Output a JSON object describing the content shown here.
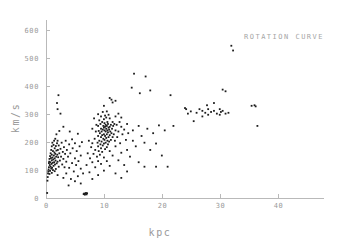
{
  "chart_data": {
    "type": "scatter",
    "title": "ROTATION CURVE",
    "xlabel": "kpc",
    "ylabel": "km/s",
    "xlim": [
      0,
      48
    ],
    "ylim": [
      0,
      630
    ],
    "grid": false,
    "legend": null,
    "xticks": [
      0,
      10,
      20,
      30,
      40
    ],
    "yticks": [
      0,
      100,
      200,
      300,
      400,
      500,
      600
    ],
    "xtick_labels": [
      "0",
      "10",
      "20",
      "30",
      "40"
    ],
    "ytick_labels": [
      "0",
      "100",
      "200",
      "300",
      "400",
      "500",
      "600"
    ],
    "marker": "dot",
    "marker_color": "#1d1d1d",
    "axis_color": "#b9b9b9",
    "label_color": "#9a9a9a",
    "n_points": 286,
    "points": [
      [
        0.2,
        18
      ],
      [
        0.25,
        62
      ],
      [
        0.3,
        75
      ],
      [
        0.35,
        88
      ],
      [
        0.4,
        95
      ],
      [
        0.45,
        102
      ],
      [
        0.5,
        110
      ],
      [
        0.5,
        125
      ],
      [
        0.55,
        130
      ],
      [
        0.6,
        86
      ],
      [
        0.6,
        140
      ],
      [
        0.65,
        118
      ],
      [
        0.7,
        97
      ],
      [
        0.7,
        150
      ],
      [
        0.75,
        128
      ],
      [
        0.8,
        112
      ],
      [
        0.8,
        160
      ],
      [
        0.85,
        143
      ],
      [
        0.9,
        105
      ],
      [
        0.9,
        172
      ],
      [
        0.95,
        122
      ],
      [
        1.0,
        90
      ],
      [
        1.0,
        135
      ],
      [
        1.0,
        155
      ],
      [
        1.0,
        185
      ],
      [
        1.05,
        108
      ],
      [
        1.1,
        145
      ],
      [
        1.1,
        198
      ],
      [
        1.15,
        126
      ],
      [
        1.2,
        100
      ],
      [
        1.2,
        168
      ],
      [
        1.25,
        138
      ],
      [
        1.3,
        115
      ],
      [
        1.3,
        190
      ],
      [
        1.35,
        152
      ],
      [
        1.4,
        128
      ],
      [
        1.4,
        205
      ],
      [
        1.45,
        163
      ],
      [
        1.5,
        96
      ],
      [
        1.5,
        142
      ],
      [
        1.5,
        178
      ],
      [
        1.55,
        120
      ],
      [
        1.6,
        158
      ],
      [
        1.6,
        212
      ],
      [
        1.65,
        134
      ],
      [
        1.7,
        104
      ],
      [
        1.7,
        186
      ],
      [
        1.75,
        148
      ],
      [
        1.8,
        170
      ],
      [
        1.8,
        228
      ],
      [
        1.85,
        124
      ],
      [
        1.9,
        196
      ],
      [
        1.9,
        340
      ],
      [
        1.95,
        155
      ],
      [
        2.0,
        82
      ],
      [
        2.0,
        130
      ],
      [
        2.0,
        205
      ],
      [
        2.0,
        318
      ],
      [
        2.05,
        172
      ],
      [
        2.1,
        146
      ],
      [
        2.15,
        368
      ],
      [
        2.2,
        112
      ],
      [
        2.2,
        188
      ],
      [
        2.3,
        160
      ],
      [
        2.3,
        240
      ],
      [
        2.4,
        134
      ],
      [
        2.5,
        176
      ],
      [
        2.5,
        302
      ],
      [
        2.6,
        148
      ],
      [
        2.7,
        198
      ],
      [
        2.8,
        120
      ],
      [
        2.9,
        165
      ],
      [
        3.0,
        72
      ],
      [
        3.0,
        140
      ],
      [
        3.0,
        255
      ],
      [
        3.1,
        182
      ],
      [
        3.2,
        110
      ],
      [
        3.3,
        158
      ],
      [
        3.4,
        205
      ],
      [
        3.5,
        88
      ],
      [
        3.5,
        130
      ],
      [
        3.6,
        172
      ],
      [
        3.8,
        148
      ],
      [
        3.9,
        45
      ],
      [
        4.0,
        108
      ],
      [
        4.0,
        192
      ],
      [
        4.1,
        238
      ],
      [
        4.2,
        160
      ],
      [
        4.3,
        68
      ],
      [
        4.5,
        125
      ],
      [
        4.5,
        210
      ],
      [
        4.6,
        178
      ],
      [
        4.8,
        95
      ],
      [
        5.0,
        142
      ],
      [
        5.0,
        60
      ],
      [
        5.0,
        196
      ],
      [
        5.2,
        118
      ],
      [
        5.3,
        168
      ],
      [
        5.5,
        78
      ],
      [
        5.5,
        230
      ],
      [
        5.6,
        132
      ],
      [
        5.8,
        185
      ],
      [
        6.0,
        52
      ],
      [
        6.0,
        105
      ],
      [
        6.0,
        152
      ],
      [
        6.2,
        200
      ],
      [
        6.4,
        88
      ],
      [
        6.5,
        14
      ],
      [
        6.6,
        16
      ],
      [
        6.7,
        12
      ],
      [
        6.8,
        15
      ],
      [
        6.9,
        18
      ],
      [
        7.0,
        13
      ],
      [
        7.0,
        118
      ],
      [
        7.1,
        17
      ],
      [
        7.2,
        160
      ],
      [
        7.4,
        205
      ],
      [
        7.5,
        92
      ],
      [
        7.6,
        142
      ],
      [
        7.8,
        182
      ],
      [
        8.0,
        68
      ],
      [
        8.0,
        128
      ],
      [
        8.0,
        196
      ],
      [
        8.0,
        248
      ],
      [
        8.2,
        158
      ],
      [
        8.3,
        285
      ],
      [
        8.4,
        212
      ],
      [
        8.5,
        110
      ],
      [
        8.5,
        172
      ],
      [
        8.6,
        238
      ],
      [
        8.7,
        262
      ],
      [
        8.8,
        148
      ],
      [
        8.9,
        198
      ],
      [
        9.0,
        82
      ],
      [
        9.0,
        132
      ],
      [
        9.0,
        185
      ],
      [
        9.0,
        222
      ],
      [
        9.0,
        258
      ],
      [
        9.0,
        300
      ],
      [
        9.1,
        168
      ],
      [
        9.1,
        240
      ],
      [
        9.2,
        205
      ],
      [
        9.2,
        278
      ],
      [
        9.3,
        155
      ],
      [
        9.3,
        232
      ],
      [
        9.4,
        192
      ],
      [
        9.4,
        265
      ],
      [
        9.5,
        122
      ],
      [
        9.5,
        178
      ],
      [
        9.5,
        218
      ],
      [
        9.5,
        248
      ],
      [
        9.5,
        292
      ],
      [
        9.6,
        202
      ],
      [
        9.6,
        238
      ],
      [
        9.7,
        165
      ],
      [
        9.7,
        225
      ],
      [
        9.7,
        272
      ],
      [
        9.8,
        188
      ],
      [
        9.8,
        245
      ],
      [
        9.8,
        308
      ],
      [
        9.9,
        212
      ],
      [
        9.9,
        258
      ],
      [
        10.0,
        98
      ],
      [
        10.0,
        145
      ],
      [
        10.0,
        195
      ],
      [
        10.0,
        228
      ],
      [
        10.0,
        252
      ],
      [
        10.0,
        282
      ],
      [
        10.0,
        330
      ],
      [
        10.1,
        208
      ],
      [
        10.1,
        242
      ],
      [
        10.1,
        268
      ],
      [
        10.2,
        175
      ],
      [
        10.2,
        222
      ],
      [
        10.2,
        255
      ],
      [
        10.2,
        295
      ],
      [
        10.3,
        198
      ],
      [
        10.3,
        238
      ],
      [
        10.3,
        262
      ],
      [
        10.4,
        215
      ],
      [
        10.4,
        248
      ],
      [
        10.4,
        288
      ],
      [
        10.5,
        132
      ],
      [
        10.5,
        182
      ],
      [
        10.5,
        228
      ],
      [
        10.5,
        258
      ],
      [
        10.5,
        310
      ],
      [
        10.6,
        205
      ],
      [
        10.6,
        242
      ],
      [
        10.6,
        272
      ],
      [
        10.7,
        192
      ],
      [
        10.7,
        235
      ],
      [
        10.7,
        265
      ],
      [
        10.8,
        218
      ],
      [
        10.8,
        252
      ],
      [
        10.8,
        298
      ],
      [
        10.9,
        202
      ],
      [
        10.9,
        245
      ],
      [
        11.0,
        115
      ],
      [
        11.0,
        168
      ],
      [
        11.0,
        225
      ],
      [
        11.0,
        255
      ],
      [
        11.0,
        285
      ],
      [
        11.0,
        358
      ],
      [
        11.1,
        238
      ],
      [
        11.2,
        208
      ],
      [
        11.2,
        262
      ],
      [
        11.3,
        232
      ],
      [
        11.3,
        352
      ],
      [
        11.4,
        248
      ],
      [
        11.5,
        152
      ],
      [
        11.5,
        218
      ],
      [
        11.5,
        272
      ],
      [
        11.5,
        342
      ],
      [
        11.6,
        258
      ],
      [
        11.7,
        228
      ],
      [
        11.8,
        265
      ],
      [
        11.9,
        205
      ],
      [
        12.0,
        88
      ],
      [
        12.0,
        185
      ],
      [
        12.0,
        242
      ],
      [
        12.0,
        292
      ],
      [
        12.0,
        348
      ],
      [
        12.2,
        262
      ],
      [
        12.3,
        218
      ],
      [
        12.5,
        135
      ],
      [
        12.5,
        238
      ],
      [
        12.5,
        302
      ],
      [
        12.7,
        272
      ],
      [
        12.8,
        196
      ],
      [
        13.0,
        72
      ],
      [
        13.0,
        162
      ],
      [
        13.0,
        255
      ],
      [
        13.0,
        288
      ],
      [
        13.2,
        228
      ],
      [
        13.5,
        118
      ],
      [
        13.5,
        245
      ],
      [
        13.8,
        208
      ],
      [
        14.0,
        95
      ],
      [
        14.0,
        172
      ],
      [
        14.0,
        265
      ],
      [
        14.2,
        232
      ],
      [
        14.5,
        148
      ],
      [
        14.8,
        395
      ],
      [
        15.0,
        205
      ],
      [
        15.0,
        242
      ],
      [
        15.2,
        445
      ],
      [
        15.5,
        185
      ],
      [
        16.0,
        128
      ],
      [
        16.0,
        258
      ],
      [
        16.2,
        375
      ],
      [
        16.5,
        222
      ],
      [
        17.0,
        112
      ],
      [
        17.0,
        198
      ],
      [
        17.2,
        435
      ],
      [
        17.5,
        248
      ],
      [
        18.0,
        172
      ],
      [
        18.0,
        385
      ],
      [
        18.5,
        232
      ],
      [
        19.0,
        112
      ],
      [
        19.0,
        195
      ],
      [
        19.5,
        260
      ],
      [
        20.0,
        152
      ],
      [
        20.5,
        242
      ],
      [
        21.0,
        112
      ],
      [
        21.5,
        368
      ],
      [
        22.0,
        258
      ],
      [
        24.0,
        322
      ],
      [
        24.2,
        318
      ],
      [
        24.5,
        302
      ],
      [
        25.0,
        310
      ],
      [
        25.5,
        275
      ],
      [
        26.0,
        305
      ],
      [
        26.5,
        318
      ],
      [
        27.0,
        292
      ],
      [
        27.0,
        312
      ],
      [
        27.5,
        305
      ],
      [
        27.8,
        332
      ],
      [
        28.0,
        298
      ],
      [
        28.0,
        318
      ],
      [
        28.5,
        308
      ],
      [
        29.0,
        312
      ],
      [
        29.0,
        340
      ],
      [
        29.5,
        302
      ],
      [
        30.0,
        298
      ],
      [
        30.0,
        318
      ],
      [
        30.2,
        308
      ],
      [
        30.5,
        312
      ],
      [
        30.5,
        388
      ],
      [
        31.0,
        302
      ],
      [
        31.0,
        382
      ],
      [
        31.5,
        305
      ],
      [
        32.0,
        545
      ],
      [
        32.3,
        528
      ],
      [
        35.5,
        330
      ],
      [
        36.0,
        332
      ],
      [
        36.2,
        328
      ],
      [
        36.5,
        258
      ]
    ]
  }
}
